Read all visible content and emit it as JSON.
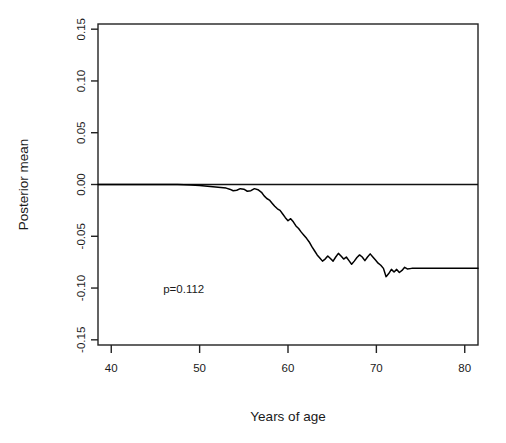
{
  "chart_data": {
    "type": "line",
    "title": "",
    "xlabel": "Years of age",
    "ylabel": "Posterior mean",
    "xlim": [
      38.5,
      81.5
    ],
    "ylim": [
      -0.155,
      0.155
    ],
    "xticks": [
      40,
      50,
      60,
      70,
      80
    ],
    "xtick_labels": [
      "40",
      "50",
      "60",
      "70",
      "80"
    ],
    "yticks": [
      -0.15,
      -0.1,
      -0.05,
      0.0,
      0.05,
      0.1,
      0.15
    ],
    "ytick_labels": [
      "-0.15",
      "-0.10",
      "-0.05",
      "0.00",
      "0.05",
      "0.10",
      "0.15"
    ],
    "grid": false,
    "legend": false,
    "reference_lines": [
      {
        "name": "zero-line",
        "orientation": "horizontal",
        "y": 0.0
      }
    ],
    "annotations": [
      {
        "name": "p-value",
        "text": "p=0.112",
        "x": 48.2,
        "y": -0.105
      }
    ],
    "series": [
      {
        "name": "Posterior mean",
        "color": "#000000",
        "x": [
          38.5,
          42.0,
          45.0,
          47.5,
          49.0,
          50.0,
          50.6,
          51.2,
          51.8,
          52.4,
          53.0,
          53.4,
          53.8,
          54.2,
          54.6,
          55.0,
          55.4,
          55.8,
          56.2,
          56.6,
          57.0,
          57.3,
          57.6,
          57.9,
          58.2,
          58.5,
          58.8,
          59.1,
          59.4,
          59.7,
          60.0,
          60.3,
          60.6,
          60.9,
          61.2,
          61.5,
          61.8,
          62.1,
          62.4,
          62.7,
          63.0,
          63.3,
          63.6,
          63.9,
          64.2,
          64.5,
          64.8,
          65.1,
          65.4,
          65.7,
          66.0,
          66.3,
          66.6,
          66.9,
          67.2,
          67.5,
          67.8,
          68.1,
          68.4,
          68.7,
          69.0,
          69.3,
          69.6,
          69.9,
          70.2,
          70.5,
          70.8,
          71.1,
          71.4,
          71.7,
          72.0,
          72.3,
          72.6,
          72.9,
          73.2,
          73.5,
          74.0,
          76.0,
          78.0,
          81.5
        ],
        "y": [
          0.0,
          0.0,
          0.0,
          0.0,
          -0.0005,
          -0.001,
          -0.0015,
          -0.002,
          -0.0025,
          -0.003,
          -0.0035,
          -0.0045,
          -0.006,
          -0.0055,
          -0.004,
          -0.0045,
          -0.0065,
          -0.006,
          -0.004,
          -0.005,
          -0.0075,
          -0.011,
          -0.0135,
          -0.015,
          -0.018,
          -0.021,
          -0.0235,
          -0.025,
          -0.0285,
          -0.032,
          -0.035,
          -0.033,
          -0.036,
          -0.04,
          -0.0425,
          -0.046,
          -0.049,
          -0.052,
          -0.0555,
          -0.06,
          -0.064,
          -0.068,
          -0.071,
          -0.074,
          -0.072,
          -0.069,
          -0.0715,
          -0.074,
          -0.07,
          -0.0665,
          -0.069,
          -0.072,
          -0.07,
          -0.0735,
          -0.077,
          -0.074,
          -0.0705,
          -0.068,
          -0.07,
          -0.0735,
          -0.07,
          -0.067,
          -0.07,
          -0.073,
          -0.076,
          -0.078,
          -0.081,
          -0.089,
          -0.086,
          -0.082,
          -0.0845,
          -0.082,
          -0.085,
          -0.083,
          -0.08,
          -0.0815,
          -0.081,
          -0.081,
          -0.081,
          -0.081
        ]
      }
    ]
  }
}
